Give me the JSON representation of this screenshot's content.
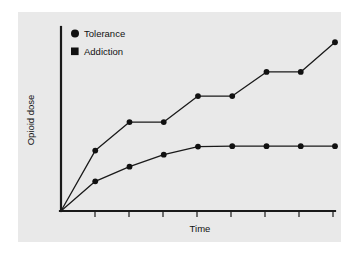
{
  "chart_data": {
    "type": "line",
    "title": "",
    "xlabel": "Time",
    "ylabel": "Opioid dose",
    "grid": false,
    "legend_position": "top-left-inside",
    "axis_ticks_labeled": false,
    "x_tick_count": 8,
    "xlim": [
      0,
      10
    ],
    "ylim": [
      0,
      10
    ],
    "series": [
      {
        "name": "Tolerance",
        "marker": "circle",
        "x": [
          0,
          1.25,
          2.5,
          3.75,
          5.0,
          6.25,
          7.5,
          8.75,
          10.0
        ],
        "y": [
          0,
          1.62,
          2.42,
          3.08,
          3.52,
          3.54,
          3.54,
          3.54,
          3.54
        ]
      },
      {
        "name": "Addiction",
        "marker": "square",
        "x": [
          0,
          1.25,
          2.5,
          3.75,
          5.0,
          6.25,
          7.5,
          8.75,
          10.0
        ],
        "y": [
          0,
          3.3,
          4.86,
          4.86,
          6.28,
          6.28,
          7.6,
          7.6,
          9.22
        ]
      }
    ]
  },
  "legend": {
    "items": [
      {
        "label": "Tolerance",
        "glyph": "circle-marker-icon"
      },
      {
        "label": "Addiction",
        "glyph": "square-marker-icon"
      }
    ]
  },
  "colors": {
    "panel_background": "#e9e9e9",
    "page_background": "#ffffff",
    "ink": "#111111",
    "axis": "#1a1a1a"
  }
}
